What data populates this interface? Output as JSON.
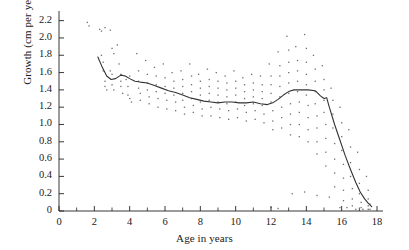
{
  "chart_data": {
    "type": "scatter",
    "title": "",
    "subtitle": "",
    "xlabel": "Age in years",
    "ylabel": "Growth (cm per year)",
    "xlim": [
      0,
      18
    ],
    "ylim": [
      0,
      2.3
    ],
    "grid": false,
    "legend": "none",
    "x_ticks_major": [
      0,
      2,
      4,
      6,
      8,
      10,
      12,
      14,
      16,
      18
    ],
    "x_ticks_minor": [
      1,
      3,
      5,
      7,
      9,
      11,
      13,
      15,
      17
    ],
    "x_tick_labels": [
      "0",
      "2",
      "4",
      "6",
      "8",
      "10",
      "12",
      "14",
      "16",
      "18"
    ],
    "y_ticks": [
      0,
      0.2,
      0.4,
      0.6,
      0.8,
      1.0,
      1.2,
      1.4,
      1.6,
      1.8,
      2.0,
      2.2
    ],
    "y_tick_labels": [
      "0",
      "0.2",
      "0.4",
      "0.6",
      "0.8",
      "1.0",
      "1.2",
      "1.4",
      "1.6",
      "1.8",
      "2.0",
      "2.2"
    ],
    "series": [
      {
        "name": "mean growth curve",
        "type": "line",
        "color": "#333333",
        "points": [
          [
            2.2,
            1.78
          ],
          [
            2.45,
            1.66
          ],
          [
            2.7,
            1.56
          ],
          [
            2.95,
            1.52
          ],
          [
            3.2,
            1.53
          ],
          [
            3.5,
            1.57
          ],
          [
            3.75,
            1.56
          ],
          [
            4.0,
            1.53
          ],
          [
            4.3,
            1.5
          ],
          [
            4.6,
            1.49
          ],
          [
            5.0,
            1.48
          ],
          [
            5.4,
            1.45
          ],
          [
            5.8,
            1.42
          ],
          [
            6.2,
            1.39
          ],
          [
            6.6,
            1.37
          ],
          [
            7.0,
            1.34
          ],
          [
            7.4,
            1.31
          ],
          [
            7.8,
            1.29
          ],
          [
            8.2,
            1.27
          ],
          [
            8.6,
            1.26
          ],
          [
            9.0,
            1.25
          ],
          [
            9.4,
            1.26
          ],
          [
            9.8,
            1.26
          ],
          [
            10.2,
            1.25
          ],
          [
            10.6,
            1.25
          ],
          [
            11.0,
            1.26
          ],
          [
            11.4,
            1.24
          ],
          [
            11.8,
            1.23
          ],
          [
            12.1,
            1.25
          ],
          [
            12.4,
            1.29
          ],
          [
            12.7,
            1.34
          ],
          [
            13.0,
            1.38
          ],
          [
            13.3,
            1.4
          ],
          [
            13.7,
            1.4
          ],
          [
            14.1,
            1.4
          ],
          [
            14.5,
            1.39
          ],
          [
            14.8,
            1.33
          ],
          [
            15.0,
            1.3
          ],
          [
            15.15,
            1.31
          ],
          [
            15.3,
            1.2
          ],
          [
            15.6,
            1.0
          ],
          [
            15.9,
            0.82
          ],
          [
            16.2,
            0.64
          ],
          [
            16.5,
            0.48
          ],
          [
            16.8,
            0.33
          ],
          [
            17.05,
            0.22
          ],
          [
            17.3,
            0.14
          ],
          [
            17.5,
            0.09
          ],
          [
            17.7,
            0.05
          ]
        ]
      },
      {
        "name": "individual growth observations",
        "type": "scatter",
        "color": "#555555",
        "marker": "dot",
        "points": [
          [
            1.6,
            2.18
          ],
          [
            1.7,
            2.14
          ],
          [
            2.3,
            2.1
          ],
          [
            2.4,
            2.08
          ],
          [
            2.6,
            2.12
          ],
          [
            2.9,
            2.09
          ],
          [
            3.0,
            1.88
          ],
          [
            3.1,
            1.82
          ],
          [
            2.4,
            1.8
          ],
          [
            2.5,
            1.72
          ],
          [
            2.5,
            1.62
          ],
          [
            2.6,
            1.5
          ],
          [
            2.6,
            1.44
          ],
          [
            2.7,
            1.4
          ],
          [
            2.9,
            1.62
          ],
          [
            3.0,
            1.58
          ],
          [
            3.0,
            1.46
          ],
          [
            3.1,
            1.4
          ],
          [
            3.3,
            1.92
          ],
          [
            3.4,
            1.7
          ],
          [
            3.5,
            1.58
          ],
          [
            3.5,
            1.5
          ],
          [
            3.5,
            1.44
          ],
          [
            3.6,
            1.36
          ],
          [
            3.8,
            1.52
          ],
          [
            3.9,
            1.44
          ],
          [
            3.9,
            1.34
          ],
          [
            4.0,
            1.56
          ],
          [
            4.0,
            1.3
          ],
          [
            4.1,
            1.26
          ],
          [
            4.4,
            1.82
          ],
          [
            4.5,
            1.62
          ],
          [
            4.5,
            1.5
          ],
          [
            4.5,
            1.42
          ],
          [
            4.6,
            1.36
          ],
          [
            4.6,
            1.28
          ],
          [
            4.9,
            1.74
          ],
          [
            5.0,
            1.58
          ],
          [
            5.0,
            1.48
          ],
          [
            5.0,
            1.4
          ],
          [
            5.1,
            1.32
          ],
          [
            5.1,
            1.24
          ],
          [
            5.4,
            1.66
          ],
          [
            5.5,
            1.56
          ],
          [
            5.5,
            1.46
          ],
          [
            5.5,
            1.38
          ],
          [
            5.6,
            1.3
          ],
          [
            5.6,
            1.2
          ],
          [
            5.9,
            1.7
          ],
          [
            6.0,
            1.54
          ],
          [
            6.0,
            1.44
          ],
          [
            6.0,
            1.36
          ],
          [
            6.1,
            1.28
          ],
          [
            6.1,
            1.18
          ],
          [
            6.4,
            1.6
          ],
          [
            6.5,
            1.5
          ],
          [
            6.5,
            1.42
          ],
          [
            6.5,
            1.34
          ],
          [
            6.6,
            1.26
          ],
          [
            6.6,
            1.16
          ],
          [
            6.9,
            1.62
          ],
          [
            7.0,
            1.52
          ],
          [
            7.0,
            1.44
          ],
          [
            7.0,
            1.36
          ],
          [
            7.0,
            1.28
          ],
          [
            7.1,
            1.2
          ],
          [
            7.1,
            1.12
          ],
          [
            7.4,
            1.7
          ],
          [
            7.5,
            1.56
          ],
          [
            7.5,
            1.46
          ],
          [
            7.5,
            1.38
          ],
          [
            7.5,
            1.3
          ],
          [
            7.6,
            1.22
          ],
          [
            7.6,
            1.14
          ],
          [
            7.9,
            1.58
          ],
          [
            8.0,
            1.5
          ],
          [
            8.0,
            1.42
          ],
          [
            8.0,
            1.34
          ],
          [
            8.0,
            1.26
          ],
          [
            8.1,
            1.18
          ],
          [
            8.1,
            1.1
          ],
          [
            8.4,
            1.64
          ],
          [
            8.5,
            1.52
          ],
          [
            8.5,
            1.44
          ],
          [
            8.5,
            1.36
          ],
          [
            8.5,
            1.28
          ],
          [
            8.6,
            1.2
          ],
          [
            8.6,
            1.1
          ],
          [
            8.9,
            1.6
          ],
          [
            9.0,
            1.5
          ],
          [
            9.0,
            1.42
          ],
          [
            9.0,
            1.34
          ],
          [
            9.0,
            1.26
          ],
          [
            9.1,
            1.18
          ],
          [
            9.1,
            1.08
          ],
          [
            9.4,
            1.56
          ],
          [
            9.5,
            1.48
          ],
          [
            9.5,
            1.4
          ],
          [
            9.5,
            1.32
          ],
          [
            9.5,
            1.24
          ],
          [
            9.6,
            1.16
          ],
          [
            9.6,
            1.06
          ],
          [
            9.9,
            1.62
          ],
          [
            10.0,
            1.5
          ],
          [
            10.0,
            1.42
          ],
          [
            10.0,
            1.34
          ],
          [
            10.0,
            1.26
          ],
          [
            10.1,
            1.18
          ],
          [
            10.1,
            1.08
          ],
          [
            10.4,
            1.54
          ],
          [
            10.5,
            1.46
          ],
          [
            10.5,
            1.38
          ],
          [
            10.5,
            1.3
          ],
          [
            10.5,
            1.22
          ],
          [
            10.6,
            1.14
          ],
          [
            10.6,
            1.04
          ],
          [
            10.9,
            1.58
          ],
          [
            11.0,
            1.48
          ],
          [
            11.0,
            1.4
          ],
          [
            11.0,
            1.32
          ],
          [
            11.0,
            1.24
          ],
          [
            11.1,
            1.16
          ],
          [
            11.1,
            1.06
          ],
          [
            11.4,
            1.56
          ],
          [
            11.5,
            1.46
          ],
          [
            11.5,
            1.38
          ],
          [
            11.5,
            1.3
          ],
          [
            11.5,
            1.22
          ],
          [
            11.6,
            1.12
          ],
          [
            11.6,
            1.02
          ],
          [
            11.9,
            1.7
          ],
          [
            12.0,
            1.56
          ],
          [
            12.0,
            1.46
          ],
          [
            12.0,
            1.36
          ],
          [
            12.0,
            1.26
          ],
          [
            12.1,
            1.16
          ],
          [
            12.1,
            1.04
          ],
          [
            12.1,
            0.94
          ],
          [
            12.4,
            1.84
          ],
          [
            12.5,
            1.68
          ],
          [
            12.5,
            1.56
          ],
          [
            12.5,
            1.44
          ],
          [
            12.5,
            1.32
          ],
          [
            12.6,
            1.2
          ],
          [
            12.6,
            1.08
          ],
          [
            12.6,
            0.96
          ],
          [
            12.9,
            2.02
          ],
          [
            13.0,
            1.86
          ],
          [
            13.0,
            1.72
          ],
          [
            13.0,
            1.6
          ],
          [
            13.0,
            1.48
          ],
          [
            13.0,
            1.36
          ],
          [
            13.1,
            1.24
          ],
          [
            13.1,
            1.12
          ],
          [
            13.1,
            1.0
          ],
          [
            13.1,
            0.88
          ],
          [
            13.4,
            1.9
          ],
          [
            13.5,
            1.74
          ],
          [
            13.5,
            1.62
          ],
          [
            13.5,
            1.5
          ],
          [
            13.5,
            1.38
          ],
          [
            13.6,
            1.26
          ],
          [
            13.6,
            1.14
          ],
          [
            13.6,
            1.0
          ],
          [
            13.6,
            0.86
          ],
          [
            13.9,
            2.04
          ],
          [
            14.0,
            1.88
          ],
          [
            14.0,
            1.72
          ],
          [
            14.0,
            1.58
          ],
          [
            14.0,
            1.46
          ],
          [
            14.0,
            1.34
          ],
          [
            14.1,
            1.22
          ],
          [
            14.1,
            1.08
          ],
          [
            14.1,
            0.94
          ],
          [
            14.1,
            0.8
          ],
          [
            14.4,
            1.8
          ],
          [
            14.5,
            1.64
          ],
          [
            14.5,
            1.5
          ],
          [
            14.5,
            1.38
          ],
          [
            14.5,
            1.24
          ],
          [
            14.6,
            1.1
          ],
          [
            14.6,
            0.96
          ],
          [
            14.6,
            0.8
          ],
          [
            14.6,
            0.66
          ],
          [
            14.9,
            1.68
          ],
          [
            15.0,
            1.52
          ],
          [
            15.0,
            1.4
          ],
          [
            15.0,
            1.28
          ],
          [
            15.0,
            1.14
          ],
          [
            15.1,
            1.0
          ],
          [
            15.1,
            0.84
          ],
          [
            15.1,
            0.68
          ],
          [
            15.1,
            0.52
          ],
          [
            15.4,
            1.42
          ],
          [
            15.5,
            1.28
          ],
          [
            15.5,
            1.12
          ],
          [
            15.5,
            0.96
          ],
          [
            15.6,
            0.78
          ],
          [
            15.6,
            0.6
          ],
          [
            15.6,
            0.44
          ],
          [
            15.6,
            0.28
          ],
          [
            15.9,
            1.2
          ],
          [
            16.0,
            1.02
          ],
          [
            16.0,
            0.86
          ],
          [
            16.0,
            0.7
          ],
          [
            16.1,
            0.54
          ],
          [
            16.1,
            0.38
          ],
          [
            16.1,
            0.24
          ],
          [
            16.1,
            0.12
          ],
          [
            16.4,
            0.94
          ],
          [
            16.5,
            0.74
          ],
          [
            16.5,
            0.56
          ],
          [
            16.5,
            0.4
          ],
          [
            16.6,
            0.26
          ],
          [
            16.6,
            0.14
          ],
          [
            16.6,
            0.06
          ],
          [
            16.9,
            0.68
          ],
          [
            17.0,
            0.48
          ],
          [
            17.0,
            0.32
          ],
          [
            17.0,
            0.2
          ],
          [
            17.1,
            0.1
          ],
          [
            17.1,
            0.04
          ],
          [
            17.4,
            0.4
          ],
          [
            17.5,
            0.24
          ],
          [
            17.5,
            0.14
          ],
          [
            17.5,
            0.06
          ],
          [
            17.5,
            0.02
          ],
          [
            17.6,
            0.08
          ],
          [
            17.6,
            0.02
          ],
          [
            16.8,
            0.02
          ],
          [
            17.2,
            0.02
          ],
          [
            15.9,
            0.04
          ],
          [
            16.3,
            0.04
          ],
          [
            13.2,
            0.2
          ],
          [
            13.9,
            0.22
          ],
          [
            14.6,
            0.18
          ],
          [
            15.3,
            0.16
          ],
          [
            12.0,
            0.04
          ],
          [
            12.4,
            0.03
          ]
        ]
      }
    ]
  }
}
